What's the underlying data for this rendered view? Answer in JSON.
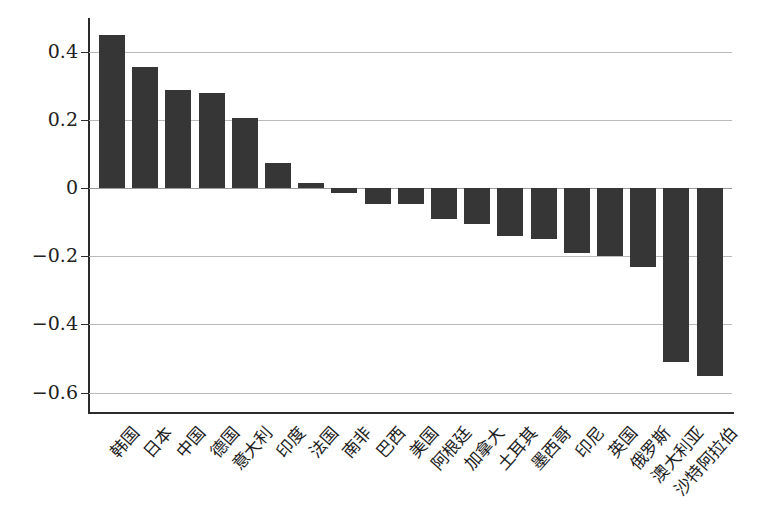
{
  "chart_data": {
    "type": "bar",
    "title": "",
    "subtitle": "",
    "xlabel": "",
    "ylabel": "",
    "ylim": [
      -0.66,
      0.5
    ],
    "yticks": [
      0.4,
      0.2,
      0,
      -0.2,
      -0.4,
      -0.6
    ],
    "ytick_labels": [
      "0.4",
      "0.2",
      "0",
      "−0.2",
      "−0.4",
      "−0.6"
    ],
    "grid": true,
    "legend": "none",
    "bar_color": "#363636",
    "gridline_color": "#b9b9b9",
    "axis_color": "#2b2b2b",
    "categories": [
      "韩国",
      "日本",
      "中国",
      "德国",
      "意大利",
      "印度",
      "法国",
      "南非",
      "巴西",
      "美国",
      "阿根廷",
      "加拿大",
      "土耳其",
      "墨西哥",
      "印尼",
      "英国",
      "俄罗斯",
      "澳大利亚",
      "沙特阿拉伯"
    ],
    "values": [
      0.45,
      0.355,
      0.29,
      0.28,
      0.205,
      0.075,
      0.015,
      -0.015,
      -0.045,
      -0.045,
      -0.09,
      -0.105,
      -0.14,
      -0.15,
      -0.19,
      -0.2,
      -0.23,
      -0.51,
      -0.55
    ]
  }
}
